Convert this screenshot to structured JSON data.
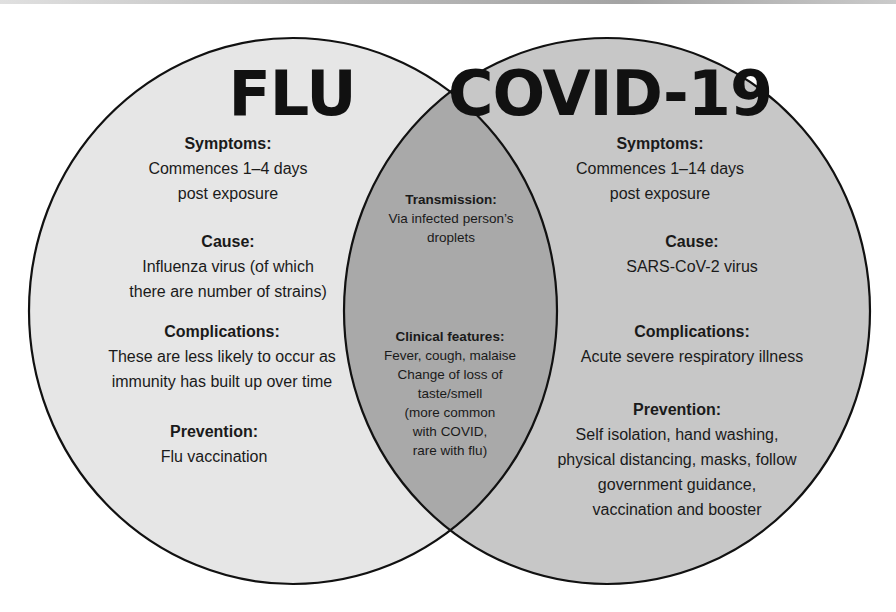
{
  "colors": {
    "flu_fill": "#e6e6e6",
    "covid_fill": "#c7c7c7",
    "overlap_fill": "#a9a9a9",
    "outline": "#111111",
    "text": "#1a1a1a"
  },
  "flu": {
    "title": "FLU",
    "sections": [
      {
        "heading": "Symptoms:",
        "lines": [
          "Commences 1–4 days",
          "post exposure"
        ]
      },
      {
        "heading": "Cause:",
        "lines": [
          "Influenza virus (of which",
          "there are number of strains)"
        ]
      },
      {
        "heading": "Complications:",
        "lines": [
          "These are less likely to occur as",
          "immunity has built up over time"
        ]
      },
      {
        "heading": "Prevention:",
        "lines": [
          "Flu vaccination"
        ]
      }
    ]
  },
  "covid": {
    "title": "COVID-19",
    "sections": [
      {
        "heading": "Symptoms:",
        "lines": [
          "Commences 1–14 days",
          "post exposure"
        ]
      },
      {
        "heading": "Cause:",
        "lines": [
          "SARS-CoV-2 virus"
        ]
      },
      {
        "heading": "Complications:",
        "lines": [
          "Acute severe respiratory illness"
        ]
      },
      {
        "heading": "Prevention:",
        "lines": [
          "Self isolation, hand washing,",
          "physical distancing, masks, follow",
          "government guidance,",
          "vaccination and booster"
        ]
      }
    ]
  },
  "overlap": {
    "sections": [
      {
        "heading": "Transmission:",
        "lines": [
          "Via infected person’s",
          "droplets"
        ]
      },
      {
        "heading": "Clinical features:",
        "lines": [
          "Fever, cough, malaise",
          "Change of loss of",
          "taste/smell",
          "(more common",
          "with COVID,",
          "rare with flu)"
        ]
      }
    ]
  }
}
